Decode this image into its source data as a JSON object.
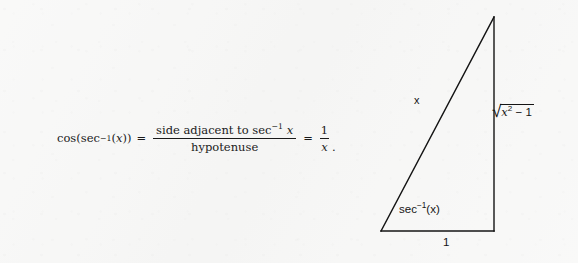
{
  "background_color": "#f7f7f6",
  "ink_color": "#141414",
  "equation": {
    "lhs_function": "cos",
    "lhs_open": "(",
    "lhs_inner_function": "sec",
    "lhs_inner_exponent": "−1",
    "lhs_inner_open": "(",
    "lhs_inner_variable": "x",
    "lhs_inner_close": ")",
    "lhs_close": ")",
    "equals_1": "=",
    "numerator_text": "side adjacent to sec",
    "numerator_exponent": "−1",
    "numerator_variable": "x",
    "denominator_text": "hypotenuse",
    "equals_2": "=",
    "result_numerator": "1",
    "result_denominator": "x",
    "terminal_period": "."
  },
  "triangle": {
    "vertices": {
      "apex": [
        126,
        17
      ],
      "bottom_left": [
        13,
        231
      ],
      "bottom_right": [
        126,
        231
      ]
    },
    "stroke_width": 1.4,
    "labels": {
      "hypotenuse": "x",
      "angle_function": "sec",
      "angle_exponent": "−1",
      "angle_argument": "(x)",
      "opposite_radicand_variable": "x",
      "opposite_radicand_exponent": "2",
      "opposite_radicand_rest": "− 1",
      "opposite_radical_symbol": "√",
      "base": "1"
    }
  }
}
